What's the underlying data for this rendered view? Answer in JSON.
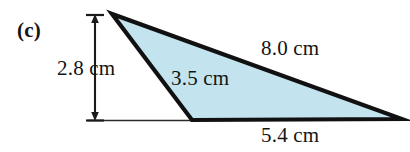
{
  "figure": {
    "part_label": "(c)",
    "shape": "triangle",
    "fill_color": "#c3e4ef",
    "stroke_color": "#111111",
    "background_color": "#ffffff",
    "vertices": {
      "apex": [
        112,
        14
      ],
      "bottom_left": [
        192,
        120
      ],
      "right": [
        402,
        119
      ]
    },
    "labels": {
      "height": "2.8 cm",
      "left_side": "3.5 cm",
      "top_side": "8.0 cm",
      "base": "5.4 cm"
    },
    "dimension_arrow": {
      "orientation": "vertical",
      "x": 95,
      "y_top": 15,
      "y_bottom": 120,
      "double_headed": true,
      "tick_color": "#1a1a1a"
    },
    "baseline": {
      "x_start": 88,
      "x_end": 192,
      "y": 120
    }
  }
}
